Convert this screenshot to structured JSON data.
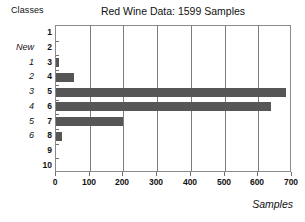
{
  "chart_data": {
    "type": "bar",
    "orientation": "horizontal",
    "title": "Red Wine Data: 1599 Samples",
    "xlabel": "Samples",
    "ylabel": "Classes",
    "categories": [
      "1",
      "2",
      "3",
      "4",
      "5",
      "6",
      "7",
      "8",
      "9",
      "10"
    ],
    "values": [
      0,
      0,
      10,
      53,
      681,
      638,
      199,
      18,
      0,
      0
    ],
    "xlim": [
      0,
      700
    ],
    "xticks": [
      0,
      100,
      200,
      300,
      400,
      500,
      600,
      700
    ],
    "xtick_labels": [
      "0",
      "100",
      "200",
      "300",
      "400",
      "500",
      "600",
      "700"
    ],
    "grid": "vertical",
    "legend": "none",
    "bar_color": "#565656",
    "frame_color": "#8a8a8a",
    "secondary_axis": {
      "label": "New",
      "labels": [
        "1",
        "2",
        "3",
        "4",
        "5",
        "6"
      ],
      "maps_to_categories": [
        "3",
        "4",
        "5",
        "6",
        "7",
        "8"
      ]
    }
  },
  "header": {
    "classes_label": "Classes"
  },
  "title": "Red Wine Data: 1599 Samples",
  "axes": {
    "x_title": "Samples",
    "new_title": "New"
  }
}
